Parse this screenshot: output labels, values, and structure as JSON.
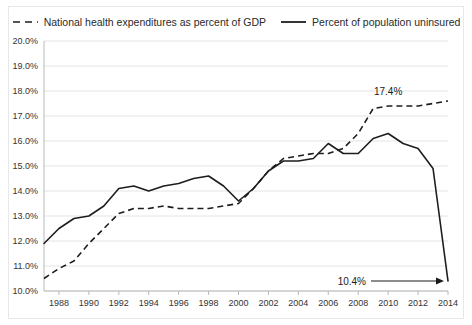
{
  "chart_data": {
    "type": "line",
    "title": "",
    "xlabel": "",
    "ylabel": "",
    "xlim": [
      1987,
      2014
    ],
    "ylim": [
      10.0,
      20.0
    ],
    "grid": true,
    "legend_position": "top",
    "x": [
      1987,
      1988,
      1989,
      1990,
      1991,
      1992,
      1993,
      1994,
      1995,
      1996,
      1997,
      1998,
      1999,
      2000,
      2001,
      2002,
      2003,
      2004,
      2005,
      2006,
      2007,
      2008,
      2009,
      2010,
      2011,
      2012,
      2013,
      2014
    ],
    "xtick_labels": [
      "1988",
      "1990",
      "1992",
      "1994",
      "1996",
      "1998",
      "2000",
      "2002",
      "2004",
      "2006",
      "2008",
      "2010",
      "2012",
      "2014"
    ],
    "xtick_values": [
      1988,
      1990,
      1992,
      1994,
      1996,
      1998,
      2000,
      2002,
      2004,
      2006,
      2008,
      2010,
      2012,
      2014
    ],
    "ytick_labels": [
      "10.0%",
      "11.0%",
      "12.0%",
      "13.0%",
      "14.0%",
      "15.0%",
      "16.0%",
      "17.0%",
      "18.0%",
      "19.0%",
      "20.0%"
    ],
    "ytick_values": [
      10.0,
      11.0,
      12.0,
      13.0,
      14.0,
      15.0,
      16.0,
      17.0,
      18.0,
      19.0,
      20.0
    ],
    "series": [
      {
        "name": "National health expenditures as percent of GDP",
        "style": "dashed",
        "color": "#1d1d1d",
        "values": [
          10.5,
          10.9,
          11.2,
          11.9,
          12.5,
          13.1,
          13.3,
          13.3,
          13.4,
          13.3,
          13.3,
          13.3,
          13.4,
          13.5,
          14.1,
          14.8,
          15.3,
          15.4,
          15.5,
          15.5,
          15.7,
          16.3,
          17.3,
          17.4,
          17.4,
          17.4,
          17.5,
          17.6
        ]
      },
      {
        "name": "Percent of population uninsured",
        "style": "solid",
        "color": "#1d1d1d",
        "values": [
          11.9,
          12.5,
          12.9,
          13.0,
          13.4,
          14.1,
          14.2,
          14.0,
          14.2,
          14.3,
          14.5,
          14.6,
          14.2,
          13.6,
          14.1,
          14.8,
          15.2,
          15.2,
          15.3,
          15.9,
          15.5,
          15.5,
          16.1,
          16.3,
          15.9,
          15.7,
          14.9,
          10.4
        ]
      }
    ],
    "annotations": [
      {
        "text": "17.4%",
        "series": "National health expenditures as percent of GDP",
        "x": 2010,
        "y": 17.4
      },
      {
        "text": "10.4%",
        "series": "Percent of population uninsured",
        "x": 2014,
        "y": 10.4
      }
    ]
  },
  "legend": {
    "items": [
      {
        "label": "National health expenditures as percent of GDP",
        "style": "dashed"
      },
      {
        "label": "Percent of population uninsured",
        "style": "solid"
      }
    ]
  }
}
